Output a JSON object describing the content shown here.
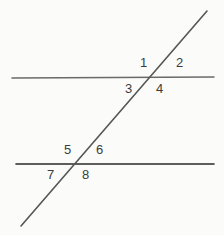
{
  "figure": {
    "background_color": "#fbfbfa",
    "lines": [
      {
        "name": "upper-parallel-line",
        "kind": "horizontal",
        "color": "#6a6a6a",
        "width": 1.6,
        "x1": 12,
        "y1": 78,
        "x2": 214,
        "y2": 77
      },
      {
        "name": "lower-parallel-line",
        "kind": "horizontal",
        "color": "#2a2a2a",
        "width": 1.6,
        "x1": 16,
        "y1": 164,
        "x2": 214,
        "y2": 164
      },
      {
        "name": "transversal-line",
        "kind": "transversal",
        "color": "#565656",
        "width": 1.6,
        "x1": 207,
        "y1": 11,
        "x2": 21,
        "y2": 226
      }
    ],
    "intersections": [
      {
        "name": "upper-intersection",
        "x": 151,
        "y": 78
      },
      {
        "name": "lower-intersection",
        "x": 73,
        "y": 165
      }
    ],
    "angle_labels": [
      {
        "id": "angle-1",
        "text": "1",
        "x": 140,
        "y": 56,
        "intersection": "upper-intersection",
        "position": "above-left"
      },
      {
        "id": "angle-2",
        "text": "2",
        "x": 176,
        "y": 56,
        "intersection": "upper-intersection",
        "position": "above-right"
      },
      {
        "id": "angle-3",
        "text": "3",
        "x": 125,
        "y": 82,
        "intersection": "upper-intersection",
        "position": "below-left"
      },
      {
        "id": "angle-4",
        "text": "4",
        "x": 156,
        "y": 82,
        "intersection": "upper-intersection",
        "position": "below-right"
      },
      {
        "id": "angle-5",
        "text": "5",
        "x": 64,
        "y": 143,
        "intersection": "lower-intersection",
        "position": "above-left"
      },
      {
        "id": "angle-6",
        "text": "6",
        "x": 96,
        "y": 143,
        "intersection": "lower-intersection",
        "position": "above-right"
      },
      {
        "id": "angle-7",
        "text": "7",
        "x": 47,
        "y": 168,
        "intersection": "lower-intersection",
        "position": "below-left"
      },
      {
        "id": "angle-8",
        "text": "8",
        "x": 82,
        "y": 168,
        "intersection": "lower-intersection",
        "position": "below-right"
      }
    ]
  }
}
